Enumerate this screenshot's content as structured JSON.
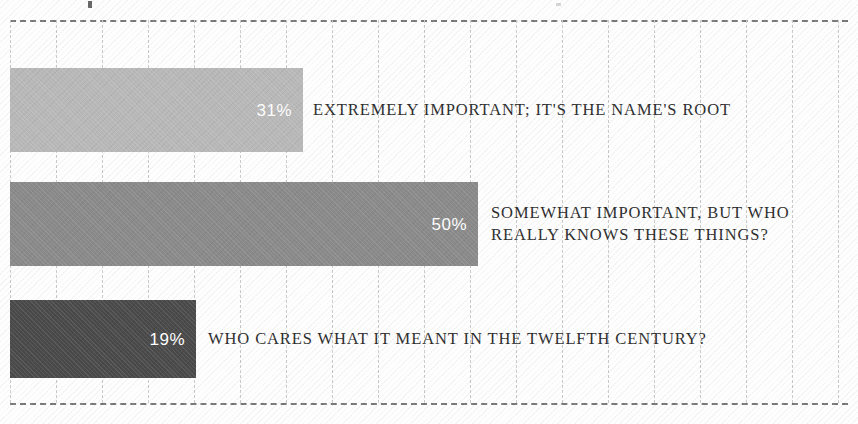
{
  "chart_data": {
    "type": "bar",
    "orientation": "horizontal",
    "title": "",
    "xlabel": "",
    "ylabel": "",
    "grid": true,
    "legend": false,
    "xlim": [
      0,
      100
    ],
    "categories": [
      "EXTREMELY IMPORTANT; IT'S THE NAME'S ROOT",
      "SOMEWHAT IMPORTANT, BUT WHO\nREALLY KNOWS THESE THINGS?",
      "WHO CARES WHAT IT MEANT IN THE TWELFTH CENTURY?"
    ],
    "values": [
      31,
      50,
      19
    ],
    "value_labels": [
      "31%",
      "50%",
      "19%"
    ],
    "bar_colors": [
      "#b8b8b8",
      "#8a8a8a",
      "#4a4a4a"
    ],
    "value_label_color": "#ffffff",
    "category_label_color": "#2b2b2b",
    "gridline_color": "#c9c9c9",
    "frame_color": "#606060",
    "bars": [
      {
        "index": 0,
        "value": 31,
        "value_label": "31%",
        "category": "EXTREMELY IMPORTANT; IT'S THE NAME'S ROOT",
        "color": "#b8b8b8",
        "px": {
          "top": 48,
          "height": 84,
          "width": 293,
          "label_left": 303
        }
      },
      {
        "index": 1,
        "value": 50,
        "value_label": "50%",
        "category": "SOMEWHAT IMPORTANT, BUT WHO\nREALLY KNOWS THESE THINGS?",
        "color": "#8a8a8a",
        "px": {
          "top": 162,
          "height": 84,
          "width": 468,
          "label_left": 481
        }
      },
      {
        "index": 2,
        "value": 19,
        "value_label": "19%",
        "category": "WHO CARES WHAT IT MEANT IN THE TWELFTH CENTURY?",
        "color": "#4a4a4a",
        "px": {
          "top": 280,
          "height": 78,
          "width": 186,
          "label_left": 198
        }
      }
    ],
    "gridlines_px": [
      0,
      46,
      92,
      138,
      184,
      230,
      276,
      322,
      368,
      414,
      460,
      506,
      552,
      598,
      644,
      690,
      736,
      782,
      828
    ]
  }
}
